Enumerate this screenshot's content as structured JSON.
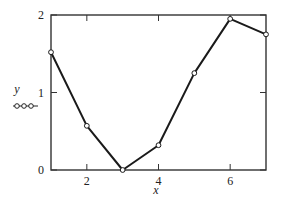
{
  "chart_data": {
    "type": "line",
    "title": "",
    "xlabel": "x",
    "ylabel": "y",
    "xlim": [
      1,
      7
    ],
    "ylim": [
      0,
      2
    ],
    "x_ticks": [
      2,
      4,
      6
    ],
    "y_ticks": [
      0,
      1,
      2
    ],
    "grid": false,
    "legend": {
      "position": "left-of-y-axis",
      "marker": "open-circles-line"
    },
    "series": [
      {
        "name": "y",
        "x": [
          1,
          2,
          3,
          4,
          5,
          6,
          7
        ],
        "values": [
          1.52,
          0.57,
          0.0,
          0.32,
          1.25,
          1.95,
          1.75
        ],
        "marker": "open-circle",
        "color": "#1a1a1a"
      }
    ]
  },
  "labels": {
    "x_axis": "x",
    "y_axis": "y",
    "x_ticks": [
      "2",
      "4",
      "6"
    ],
    "y_ticks": [
      "0",
      "1",
      "2"
    ]
  }
}
